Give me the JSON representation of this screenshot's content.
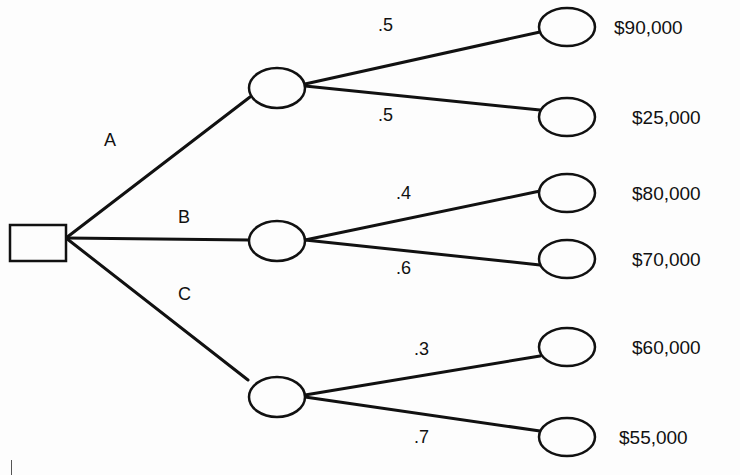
{
  "diagram": {
    "type": "decision-tree",
    "decision_node": {
      "shape": "square"
    },
    "branches": [
      {
        "label": "A",
        "outcomes": [
          {
            "probability": ".5",
            "payoff": "$90,000"
          },
          {
            "probability": ".5",
            "payoff": "$25,000"
          }
        ]
      },
      {
        "label": "B",
        "outcomes": [
          {
            "probability": ".4",
            "payoff": "$80,000"
          },
          {
            "probability": ".6",
            "payoff": "$70,000"
          }
        ]
      },
      {
        "label": "C",
        "outcomes": [
          {
            "probability": ".3",
            "payoff": "$60,000"
          },
          {
            "probability": ".7",
            "payoff": "$55,000"
          }
        ]
      }
    ],
    "colors": {
      "stroke": "#111111",
      "background": "#fdfdfd"
    }
  }
}
